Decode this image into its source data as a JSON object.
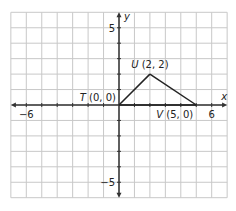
{
  "diagram": {
    "type": "coordinate-plane",
    "x_axis": {
      "label": "x",
      "min": -7,
      "max": 7,
      "tick_labels": [
        {
          "value": -6,
          "text": "−6"
        },
        {
          "value": 6,
          "text": "6"
        }
      ]
    },
    "y_axis": {
      "label": "y",
      "min": -6,
      "max": 6,
      "tick_labels": [
        {
          "value": 5,
          "text": "5"
        },
        {
          "value": -5,
          "text": "−5"
        }
      ]
    },
    "points": [
      {
        "name": "T",
        "x": 0,
        "y": 0,
        "label": "T (0, 0)"
      },
      {
        "name": "U",
        "x": 2,
        "y": 2,
        "label": "U (2, 2)"
      },
      {
        "name": "V",
        "x": 5,
        "y": 0,
        "label": "V (5, 0)"
      }
    ],
    "segments": [
      [
        "T",
        "U"
      ],
      [
        "U",
        "V"
      ],
      [
        "T",
        "V"
      ]
    ],
    "colors": {
      "grid": "#c8c8c8",
      "axis": "#333333",
      "triangle": "#222222"
    }
  }
}
